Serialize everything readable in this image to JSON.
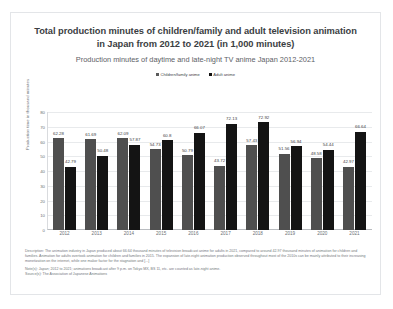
{
  "header": {
    "title": "Total production minutes of children/family and adult television animation in Japan from 2012 to 2021 (in 1,000 minutes)",
    "subtitle": "Production minutes of daytime and late-night TV anime Japan 2012-2021"
  },
  "legend": {
    "items": [
      {
        "label": "Children/family anime",
        "color": "#4f4f4f"
      },
      {
        "label": "Adult anime",
        "color": "#141414"
      }
    ]
  },
  "footer": {
    "description": "Description: The animation industry in Japan produced about 66.64 thousand minutes of television broadcast anime for adults in 2021, compared to around 42.97 thousand minutes of animation for children and families. Animation for adults overtook animation for children and families in 2015. The expansion of late-night animation production observed throughout most of the 2010s can be mainly attributed to their increasing monetization on the internet, while one makor factor for the stagnation and [...]",
    "note": "Note(s): Japan; 2012 to 2021; animations broadcast after 9 p.m. on Tokyo MX, BS 11, etc. are counted as late-night anime.",
    "source": "Source(s): The Association of Japanese Animations"
  },
  "chart_data": {
    "type": "bar",
    "title": "Total production minutes of children/family and adult television animation in Japan from 2012 to 2021 (in 1,000 minutes)",
    "subtitle": "Production minutes of daytime and late-night TV anime Japan 2012-2021",
    "xlabel": "",
    "ylabel": "Production time in thousand minutes",
    "ylim": [
      0,
      80
    ],
    "yticks": [
      0,
      10,
      20,
      30,
      40,
      50,
      60,
      70,
      80
    ],
    "grid": true,
    "legend_position": "top-center",
    "categories": [
      "2012",
      "2013",
      "2014",
      "2015",
      "2016",
      "2017",
      "2018",
      "2019",
      "2020",
      "2021"
    ],
    "series": [
      {
        "name": "Children/family anime",
        "color": "#4f4f4f",
        "values": [
          62.28,
          61.69,
          62.09,
          54.73,
          50.79,
          43.72,
          57.43,
          51.56,
          48.58,
          42.97
        ]
      },
      {
        "name": "Adult anime",
        "color": "#141414",
        "values": [
          42.79,
          50.48,
          57.87,
          60.8,
          66.07,
          72.13,
          72.92,
          56.94,
          54.44,
          66.64
        ]
      }
    ]
  }
}
